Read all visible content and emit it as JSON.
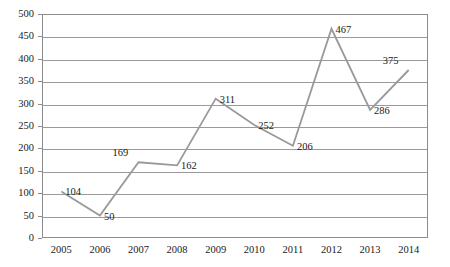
{
  "chart_data": {
    "type": "line",
    "title": "",
    "subtitle": "",
    "xlabel": "",
    "ylabel": "",
    "categories": [
      "2005",
      "2006",
      "2007",
      "2008",
      "2009",
      "2010",
      "2011",
      "2012",
      "2013",
      "2014"
    ],
    "values": [
      104,
      50,
      169,
      162,
      311,
      252,
      206,
      467,
      286,
      375
    ],
    "series": [
      {
        "name": "",
        "values": [
          104,
          50,
          169,
          162,
          311,
          252,
          206,
          467,
          286,
          375
        ]
      }
    ],
    "point_labels": [
      "104",
      "50",
      "169",
      "162",
      "311",
      "252",
      "206",
      "467",
      "286",
      "375"
    ],
    "label_placement": [
      "right",
      "right",
      "above-left",
      "right",
      "right",
      "right",
      "right",
      "right",
      "right",
      "above-left"
    ],
    "ylim": [
      0,
      500
    ],
    "ytick_step": 50,
    "yticks": [
      "500",
      "450",
      "400",
      "350",
      "300",
      "250",
      "200",
      "150",
      "100",
      "50",
      "0"
    ],
    "ytick_values": [
      500,
      450,
      400,
      350,
      300,
      250,
      200,
      150,
      100,
      50,
      0
    ],
    "xticks": [
      "2005",
      "2006",
      "2007",
      "2008",
      "2009",
      "2010",
      "2011",
      "2012",
      "2013",
      "2014"
    ],
    "grid": "horizontal",
    "legend": "none",
    "markers": "none",
    "colors": {
      "line": "#999999",
      "gridline": "#9a9a9a",
      "border": "#8c8c8c",
      "background": "#ffffff",
      "text": "#1a1a1a"
    },
    "annotations": []
  }
}
